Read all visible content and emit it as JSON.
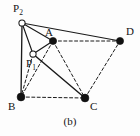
{
  "figure": {
    "caption": "(b)",
    "width": 140,
    "height": 136,
    "background_color": "#fdfdfd",
    "stroke_color": "#1a1a1a",
    "node_fill_color": "#111111",
    "node_open_fill_color": "#ffffff",
    "dash_pattern": "3,2.4"
  },
  "chart_data": {
    "type": "diagram",
    "title": "(b)",
    "nodes": [
      {
        "id": "P2",
        "label": "P",
        "sub": "2",
        "x": 22,
        "y": 23,
        "style": "open-circle",
        "radius": 3.1,
        "label_x": 13,
        "label_y": 3
      },
      {
        "id": "A",
        "label": "A",
        "sub": "",
        "x": 53,
        "y": 41,
        "style": "filled-dot",
        "radius": 3.6,
        "label_x": 45,
        "label_y": 27
      },
      {
        "id": "D",
        "label": "D",
        "sub": "",
        "x": 120,
        "y": 41,
        "style": "filled-dot",
        "radius": 3.6,
        "label_x": 126,
        "label_y": 26
      },
      {
        "id": "P1",
        "label": "P",
        "sub": "1",
        "x": 33,
        "y": 54,
        "style": "open-circle",
        "radius": 3.1,
        "label_x": 26,
        "label_y": 58
      },
      {
        "id": "B",
        "label": "B",
        "sub": "",
        "x": 21,
        "y": 97,
        "style": "filled-dot",
        "radius": 3.9,
        "label_x": 8,
        "label_y": 101
      },
      {
        "id": "C",
        "label": "C",
        "sub": "",
        "x": 85,
        "y": 98,
        "style": "filled-dot",
        "radius": 3.9,
        "label_x": 90,
        "label_y": 101
      }
    ],
    "edges": [
      {
        "from": "P2",
        "to": "D",
        "style": "solid",
        "width": 1.15
      },
      {
        "from": "P2",
        "to": "B",
        "style": "solid",
        "width": 1.35
      },
      {
        "from": "P2",
        "to": "P1",
        "style": "solid",
        "width": 1.15
      },
      {
        "from": "P2",
        "to": "A",
        "style": "solid",
        "width": 1.15
      },
      {
        "from": "P1",
        "to": "A",
        "style": "solid",
        "width": 1.25
      },
      {
        "from": "P1",
        "to": "C",
        "style": "solid",
        "width": 1.45
      },
      {
        "from": "A",
        "to": "D",
        "style": "dashed",
        "width": 1.0
      },
      {
        "from": "A",
        "to": "B",
        "style": "dashed",
        "width": 1.0
      },
      {
        "from": "A",
        "to": "C",
        "style": "dashed",
        "width": 1.0
      },
      {
        "from": "B",
        "to": "C",
        "style": "dashed",
        "width": 1.0
      },
      {
        "from": "C",
        "to": "D",
        "style": "dashed",
        "width": 1.0
      },
      {
        "from": "P1",
        "to": "B",
        "style": "dashed",
        "width": 1.0
      }
    ],
    "legend": [],
    "annotations": [
      {
        "text": "(b)",
        "role": "figure-caption",
        "x": 68,
        "y": 123
      }
    ]
  }
}
